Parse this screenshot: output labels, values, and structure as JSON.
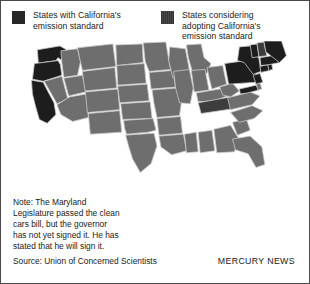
{
  "legend": {
    "items": [
      {
        "label": "States with California's\nemission standard",
        "swatch": "adopted",
        "color": "#272727"
      },
      {
        "label": "States considering\nadopting California's\nemission standard",
        "swatch": "considering",
        "color": "#3f3f3f"
      }
    ]
  },
  "map": {
    "title": "united-states-emission-standards-map",
    "colors": {
      "adopted": "#1d1d1d",
      "considering": "#3d3d3d",
      "neutral": "#6e6e6e",
      "border": "#c9c9c9",
      "background": "#ffffff"
    },
    "states": [
      {
        "code": "WA",
        "name": "Washington",
        "status": "adopted"
      },
      {
        "code": "OR",
        "name": "Oregon",
        "status": "adopted"
      },
      {
        "code": "CA",
        "name": "California",
        "status": "adopted"
      },
      {
        "code": "NV",
        "name": "Nevada",
        "status": "neutral"
      },
      {
        "code": "ID",
        "name": "Idaho",
        "status": "neutral"
      },
      {
        "code": "MT",
        "name": "Montana",
        "status": "neutral"
      },
      {
        "code": "WY",
        "name": "Wyoming",
        "status": "neutral"
      },
      {
        "code": "UT",
        "name": "Utah",
        "status": "neutral"
      },
      {
        "code": "AZ",
        "name": "Arizona",
        "status": "neutral"
      },
      {
        "code": "CO",
        "name": "Colorado",
        "status": "neutral"
      },
      {
        "code": "NM",
        "name": "New Mexico",
        "status": "neutral"
      },
      {
        "code": "ND",
        "name": "North Dakota",
        "status": "neutral"
      },
      {
        "code": "SD",
        "name": "South Dakota",
        "status": "neutral"
      },
      {
        "code": "NE",
        "name": "Nebraska",
        "status": "neutral"
      },
      {
        "code": "KS",
        "name": "Kansas",
        "status": "neutral"
      },
      {
        "code": "OK",
        "name": "Oklahoma",
        "status": "neutral"
      },
      {
        "code": "TX",
        "name": "Texas",
        "status": "neutral"
      },
      {
        "code": "MN",
        "name": "Minnesota",
        "status": "neutral"
      },
      {
        "code": "IA",
        "name": "Iowa",
        "status": "neutral"
      },
      {
        "code": "MO",
        "name": "Missouri",
        "status": "neutral"
      },
      {
        "code": "AR",
        "name": "Arkansas",
        "status": "neutral"
      },
      {
        "code": "LA",
        "name": "Louisiana",
        "status": "neutral"
      },
      {
        "code": "WI",
        "name": "Wisconsin",
        "status": "neutral"
      },
      {
        "code": "IL",
        "name": "Illinois",
        "status": "neutral"
      },
      {
        "code": "MI",
        "name": "Michigan",
        "status": "neutral"
      },
      {
        "code": "IN",
        "name": "Indiana",
        "status": "neutral"
      },
      {
        "code": "OH",
        "name": "Ohio",
        "status": "neutral"
      },
      {
        "code": "KY",
        "name": "Kentucky",
        "status": "neutral"
      },
      {
        "code": "TN",
        "name": "Tennessee",
        "status": "considering"
      },
      {
        "code": "MS",
        "name": "Mississippi",
        "status": "neutral"
      },
      {
        "code": "AL",
        "name": "Alabama",
        "status": "neutral"
      },
      {
        "code": "GA",
        "name": "Georgia",
        "status": "neutral"
      },
      {
        "code": "FL",
        "name": "Florida",
        "status": "neutral"
      },
      {
        "code": "SC",
        "name": "South Carolina",
        "status": "neutral"
      },
      {
        "code": "NC",
        "name": "North Carolina",
        "status": "neutral"
      },
      {
        "code": "VA",
        "name": "Virginia",
        "status": "neutral"
      },
      {
        "code": "WV",
        "name": "West Virginia",
        "status": "neutral"
      },
      {
        "code": "MD",
        "name": "Maryland",
        "status": "adopted"
      },
      {
        "code": "DE",
        "name": "Delaware",
        "status": "neutral"
      },
      {
        "code": "PA",
        "name": "Pennsylvania",
        "status": "adopted"
      },
      {
        "code": "NJ",
        "name": "New Jersey",
        "status": "adopted"
      },
      {
        "code": "NY",
        "name": "New York",
        "status": "adopted"
      },
      {
        "code": "CT",
        "name": "Connecticut",
        "status": "adopted"
      },
      {
        "code": "RI",
        "name": "Rhode Island",
        "status": "adopted"
      },
      {
        "code": "MA",
        "name": "Massachusetts",
        "status": "adopted"
      },
      {
        "code": "VT",
        "name": "Vermont",
        "status": "adopted"
      },
      {
        "code": "NH",
        "name": "New Hampshire",
        "status": "considering"
      },
      {
        "code": "ME",
        "name": "Maine",
        "status": "adopted"
      }
    ]
  },
  "note": "Note: The Maryland\nLegislature passed the clean\ncars bill, but the governor\nhas not yet signed it. He has\nstated that he will sign it.",
  "source": "Source: Union of Concerned Scientists",
  "credit": "MERCURY NEWS"
}
